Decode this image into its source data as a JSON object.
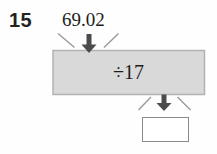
{
  "problem": {
    "number": "15",
    "input_value": "69.02",
    "operation": "÷17",
    "answer_value": ""
  },
  "icons": {
    "top_arrow": "arrow-down",
    "bottom_arrow": "arrow-down"
  },
  "colors": {
    "background": "#fefefe",
    "operation_box_fill": "#d9d9d9",
    "operation_box_border": "#b2b2b2",
    "arrow": "#4b4b4b",
    "funnel_line": "#9a9a9a",
    "answer_box_fill": "#ffffff",
    "answer_box_border": "#8a8a8a",
    "text": "#1c1c1c"
  }
}
